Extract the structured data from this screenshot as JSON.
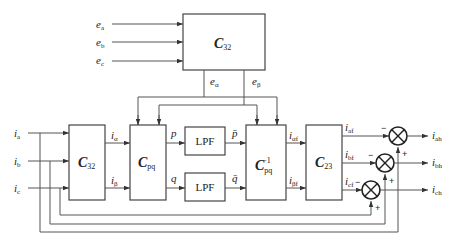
{
  "diagram": {
    "type": "block-diagram",
    "inputs": {
      "voltages": [
        {
          "base": "e",
          "sub": "a"
        },
        {
          "base": "e",
          "sub": "b"
        },
        {
          "base": "e",
          "sub": "c"
        }
      ],
      "currents": [
        {
          "base": "i",
          "sub": "a"
        },
        {
          "base": "i",
          "sub": "b"
        },
        {
          "base": "i",
          "sub": "c"
        }
      ]
    },
    "blocks": {
      "voltage_transform": {
        "base": "C",
        "sub": "32"
      },
      "current_transform": {
        "base": "C",
        "sub": "32"
      },
      "pq_transform": {
        "base": "C",
        "sub": "pq"
      },
      "lpf_p": {
        "label": "LPF"
      },
      "lpf_q": {
        "label": "LPF"
      },
      "pq_inverse": {
        "base": "C",
        "sub": "pq",
        "sup": "−1"
      },
      "inverse_transform": {
        "base": "C",
        "sub": "23"
      }
    },
    "signals": {
      "e_alpha": {
        "base": "e",
        "sub": "α"
      },
      "e_beta": {
        "base": "e",
        "sub": "β"
      },
      "i_alpha": {
        "base": "i",
        "sub": "α"
      },
      "i_beta": {
        "base": "i",
        "sub": "β"
      },
      "p": "p",
      "q": "q",
      "p_bar": "p̄",
      "q_bar": "q̄",
      "i_alpha_f": {
        "base": "i",
        "sub": "αf"
      },
      "i_beta_f": {
        "base": "i",
        "sub": "βf"
      },
      "i_af": {
        "base": "i",
        "sub": "af"
      },
      "i_bf": {
        "base": "i",
        "sub": "bf"
      },
      "i_cf": {
        "base": "i",
        "sub": "cf"
      }
    },
    "outputs": [
      {
        "base": "i",
        "sub": "ah"
      },
      {
        "base": "i",
        "sub": "bh"
      },
      {
        "base": "i",
        "sub": "ch"
      }
    ],
    "summing_signs": {
      "minus": "−",
      "plus": "+"
    }
  }
}
